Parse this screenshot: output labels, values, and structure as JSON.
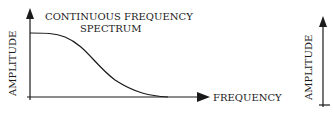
{
  "left_panel": {
    "title_line1": "CONTINUOUS FREQUENCY",
    "title_line2": "SPECTRUM",
    "y_label": "AMPLITUDE",
    "x_label": "FREQUENCY"
  },
  "right_panel": {
    "y_label": "AMPLITUDE"
  },
  "colors": {
    "ink": "#1a1a1a",
    "background": "#ffffff"
  }
}
